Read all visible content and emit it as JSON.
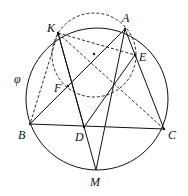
{
  "figure": {
    "circle_label": "φ",
    "points": {
      "A": {
        "label": "A",
        "x": 125,
        "y": 29
      },
      "K": {
        "label": "K",
        "x": 58,
        "y": 33
      },
      "E": {
        "label": "E",
        "x": 135,
        "y": 55
      },
      "F": {
        "label": "F",
        "x": 68,
        "y": 86
      },
      "B": {
        "label": "B",
        "x": 30,
        "y": 124
      },
      "D": {
        "label": "D",
        "x": 84,
        "y": 127
      },
      "C": {
        "label": "C",
        "x": 164,
        "y": 129
      },
      "M": {
        "label": "M",
        "x": 96,
        "y": 170
      }
    }
  }
}
